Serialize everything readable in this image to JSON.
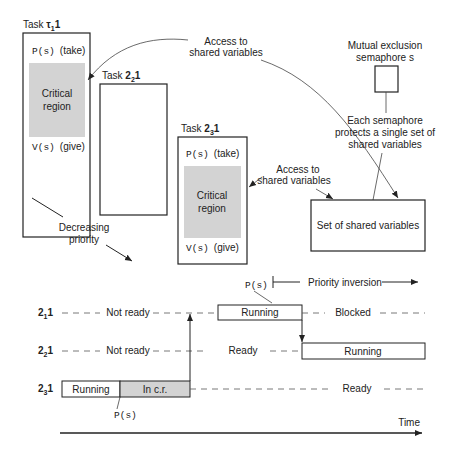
{
  "tasks": [
    {
      "id": "t1",
      "title": "Task ",
      "name_base": "τ",
      "name_sub": "1",
      "name_suffix": "1",
      "take": "P(s)",
      "take_label": "(take)",
      "critical": [
        "Critical",
        "region"
      ],
      "give": "V(s)",
      "give_label": "(give)"
    },
    {
      "id": "t2",
      "title": "Task ",
      "name_base": "2",
      "name_sub": "2",
      "name_suffix": "1"
    },
    {
      "id": "t3",
      "title": "Task ",
      "name_base": "2",
      "name_sub": "3",
      "name_suffix": "1",
      "take": "P(s)",
      "take_label": "(take)",
      "critical": [
        "Critical",
        "region"
      ],
      "give": "V(s)",
      "give_label": "(give)"
    }
  ],
  "annotations": {
    "access_top": [
      "Access to",
      "shared variables"
    ],
    "access_mid": [
      "Access to",
      "shared variables"
    ],
    "semaphore": [
      "Mutual exclusion",
      "semaphore s"
    ],
    "semaphore_note": [
      "Each semaphore",
      "protects a single set of",
      "shared variables"
    ],
    "shared_set": "Set of shared variables",
    "priority": [
      "Decreasing",
      "priority"
    ]
  },
  "timeline": {
    "priority_inversion": "Priority inversion",
    "ps_top": "P(s)",
    "ps_bottom": "P(s)",
    "time_label": "Time",
    "rows": [
      {
        "base": "2",
        "sub": "1",
        "suffix": "1",
        "segments": [
          {
            "label": "Not ready",
            "style": "dashed"
          },
          {
            "label": "Running",
            "style": "box"
          },
          {
            "label": "Blocked",
            "style": "dashed"
          }
        ]
      },
      {
        "base": "2",
        "sub": "2",
        "suffix": "1",
        "segments": [
          {
            "label": "Not ready",
            "style": "dashed"
          },
          {
            "label": "Ready",
            "style": "dashed"
          },
          {
            "label": "Running",
            "style": "box"
          }
        ]
      },
      {
        "base": "2",
        "sub": "3",
        "suffix": "1",
        "segments": [
          {
            "label": "Running",
            "style": "box"
          },
          {
            "label": "In c.r.",
            "style": "gray-box"
          },
          {
            "label": "Ready",
            "style": "dashed"
          }
        ]
      }
    ]
  },
  "colors": {
    "line": "#222222",
    "gray": "#d3d3d3",
    "dash": "#555555"
  }
}
